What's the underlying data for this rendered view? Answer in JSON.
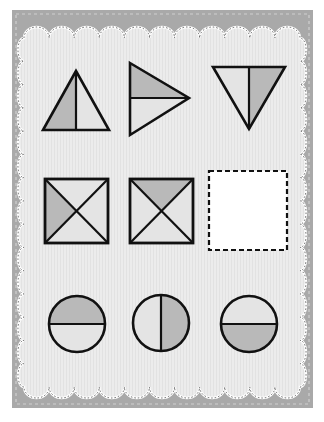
{
  "worksheet": {
    "title": "",
    "colors": {
      "frame": "#a9a9a9",
      "frame_stitch": "#d6d6d6",
      "panel": "#ececec",
      "panel_outline": "#ffffff",
      "shaded": "#b9b9b9",
      "unshaded": "#e4e4e4",
      "stroke": "#111111",
      "answer_box": "#ffffff"
    },
    "rows": [
      {
        "name": "triangles",
        "items": [
          {
            "shape": "triangle-up",
            "split": "vertical",
            "shaded_part": "left"
          },
          {
            "shape": "triangle-right",
            "split": "horizontal",
            "shaded_part": "top"
          },
          {
            "shape": "triangle-down",
            "split": "vertical",
            "shaded_part": "right"
          }
        ]
      },
      {
        "name": "squares",
        "items": [
          {
            "shape": "square",
            "split": "diagonals",
            "shaded_part": "left"
          },
          {
            "shape": "square",
            "split": "diagonals",
            "shaded_part": "top"
          },
          {
            "shape": "answer-box",
            "split": "none",
            "shaded_part": "none"
          }
        ]
      },
      {
        "name": "circles",
        "items": [
          {
            "shape": "circle",
            "split": "horizontal",
            "shaded_part": "top"
          },
          {
            "shape": "circle",
            "split": "vertical",
            "shaded_part": "right"
          },
          {
            "shape": "circle",
            "split": "horizontal",
            "shaded_part": "bottom"
          }
        ]
      }
    ]
  }
}
